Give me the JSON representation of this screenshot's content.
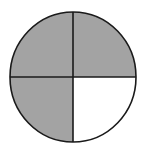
{
  "figure": {
    "type": "fraction-circle",
    "total_parts": 4,
    "shaded_parts": 3,
    "fraction_shaded": "3/4",
    "parts": [
      {
        "position": "top-left",
        "shaded": true
      },
      {
        "position": "top-right",
        "shaded": true
      },
      {
        "position": "bottom-left",
        "shaded": true
      },
      {
        "position": "bottom-right",
        "shaded": false
      }
    ],
    "colors": {
      "shaded": "#a3a3a3",
      "unshaded": "#ffffff",
      "stroke": "#1a1a1a"
    }
  }
}
